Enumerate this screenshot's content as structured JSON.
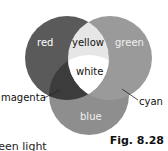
{
  "diagram": {
    "type": "additive-color-venn",
    "circles": [
      {
        "name": "red",
        "label": "red",
        "cx": 67,
        "cy": 58,
        "r": 42,
        "fill": "#5a5a5a"
      },
      {
        "name": "green",
        "label": "green",
        "cx": 110,
        "cy": 58,
        "r": 42,
        "fill": "#9a9a9a"
      },
      {
        "name": "blue",
        "label": "blue",
        "cx": 89,
        "cy": 95,
        "r": 40,
        "fill": "#8e8e8e"
      }
    ],
    "overlaps": {
      "yellow": {
        "label": "yellow",
        "fill": "#e6e6e6"
      },
      "white": {
        "label": "white",
        "fill": "#ffffff"
      },
      "magenta": {
        "label": "magenta",
        "fill": "#3c3c3c"
      },
      "cyan": {
        "label": "cyan",
        "fill": "#9a9a9a"
      }
    },
    "labels": {
      "red": "red",
      "green": "green",
      "blue": "blue",
      "yellow": "yellow",
      "white": "white",
      "magenta": "magenta",
      "cyan": "cyan"
    }
  },
  "figure_label": "Fig. 8.28",
  "caption_fragment": "reen light"
}
